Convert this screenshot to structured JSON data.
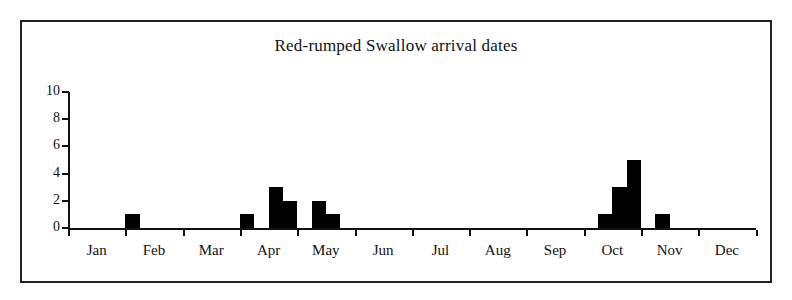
{
  "chart_data": {
    "type": "bar",
    "title": "Red-rumped Swallow arrival dates",
    "xlabel": "",
    "ylabel": "",
    "ylim": [
      0,
      10
    ],
    "yticks": [
      0,
      2,
      4,
      6,
      8,
      10
    ],
    "grid": false,
    "legend": null,
    "categories": [
      "Jan",
      "Feb",
      "Mar",
      "Apr",
      "May",
      "Jun",
      "Jul",
      "Aug",
      "Sep",
      "Oct",
      "Nov",
      "Dec"
    ],
    "bar_color": "#000000",
    "note": "Counts are recorded in sub-monthly (approx. weekly/quarter-month) bins along a Jan-Dec axis; only non-zero bins are drawn.",
    "bins": [
      {
        "label": "Feb bin 1",
        "month": "Feb",
        "value": 1
      },
      {
        "label": "Apr bin 1",
        "month": "Apr",
        "value": 1
      },
      {
        "label": "Apr bin 3",
        "month": "Apr",
        "value": 3
      },
      {
        "label": "Apr bin 4",
        "month": "Apr",
        "value": 2
      },
      {
        "label": "May bin 2",
        "month": "May",
        "value": 2
      },
      {
        "label": "May bin 3",
        "month": "May",
        "value": 1
      },
      {
        "label": "Oct bin 2",
        "month": "Oct",
        "value": 1
      },
      {
        "label": "Oct bin 3",
        "month": "Oct",
        "value": 3
      },
      {
        "label": "Oct bin 4",
        "month": "Oct",
        "value": 5
      },
      {
        "label": "Nov bin 2",
        "month": "Nov",
        "value": 1
      }
    ],
    "values_by_month": {
      "Jan": 0,
      "Feb": 1,
      "Mar": 0,
      "Apr": 6,
      "May": 3,
      "Jun": 0,
      "Jul": 0,
      "Aug": 0,
      "Sep": 0,
      "Oct": 9,
      "Nov": 1,
      "Dec": 0
    },
    "max_value": 5,
    "total": 20
  },
  "axes": {
    "y_tick_labels": [
      "10",
      "8",
      "6",
      "4",
      "2",
      "0"
    ],
    "x_tick_labels": [
      "Jan",
      "Feb",
      "Mar",
      "Apr",
      "May",
      "Jun",
      "Jul",
      "Aug",
      "Sep",
      "Oct",
      "Nov",
      "Dec"
    ]
  }
}
